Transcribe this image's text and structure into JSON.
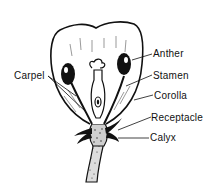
{
  "diagram": {
    "labels": {
      "anther": "Anther",
      "stamen": "Stamen",
      "corolla": "Corolla",
      "receptacle": "Receptacle",
      "calyx": "Calyx",
      "carpel": "Carpel"
    },
    "colors": {
      "ink": "#111111",
      "background": "#ffffff"
    }
  }
}
